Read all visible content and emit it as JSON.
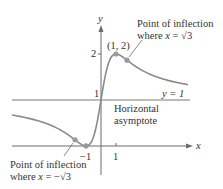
{
  "figure": {
    "function": "f(x) = (x+1)^2/(x^2+1)",
    "axis_labels": {
      "x": "x",
      "y": "y"
    },
    "tick_labels": {
      "x_neg1": "−1",
      "x_pos1": "1",
      "y_1": "1",
      "y_2": "2"
    },
    "max_point": {
      "label": "(1, 2)",
      "x": 1,
      "y": 2
    },
    "asymptote": {
      "label": "y = 1",
      "text_line1": "Horizontal",
      "text_line2": "asymptote"
    },
    "inflection_right": {
      "line1": "Point of inflection",
      "line2_prefix": "where ",
      "line2_var": "x",
      "line2_rest": " = √3"
    },
    "inflection_left": {
      "line1": "Point of inflection",
      "line2_prefix": "where ",
      "line2_var": "x",
      "line2_rest": " = −√3"
    },
    "colors": {
      "curve": "#8a8a8a",
      "axes": "#6b6b6b",
      "asymptote": "#7a7a7a",
      "point": "#9a9a9a",
      "text": "#333333"
    }
  },
  "chart_data": {
    "type": "line",
    "title": "",
    "xlabel": "x",
    "ylabel": "y",
    "series": [
      {
        "name": "f(x) = (x+1)^2/(x^2+1)",
        "x": [
          -6,
          -5,
          -4,
          -3,
          -2,
          -1.732,
          -1,
          0,
          1,
          1.732,
          3,
          4,
          5,
          6
        ],
        "values": [
          0.676,
          0.615,
          0.529,
          0.4,
          0.2,
          0.134,
          0,
          1,
          2,
          1.866,
          1.6,
          1.471,
          1.385,
          1.324
        ]
      }
    ],
    "annotations": [
      "(1, 2)",
      "y = 1",
      "Horizontal asymptote",
      "Point of inflection where x = √3",
      "Point of inflection where x = −√3"
    ],
    "xticks": [
      -1,
      1
    ],
    "yticks": [
      1,
      2
    ],
    "grid": false
  }
}
